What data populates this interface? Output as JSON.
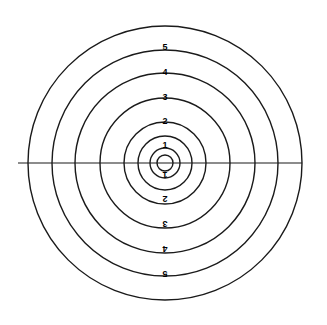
{
  "figure": {
    "name": "concentric-ring-shooting-target",
    "width": 327,
    "height": 325,
    "background_color": "#ffffff",
    "stroke_color": "#1a1a1a",
    "label_color": "#000000"
  },
  "chart_data": {
    "type": "scatter",
    "title": "",
    "subtitle": "",
    "xlabel": "",
    "ylabel": "",
    "grid": false,
    "legend": null,
    "center": {
      "x": 165,
      "y": 163
    },
    "rings": [
      {
        "label": "",
        "radius": 8,
        "stroke_width": 1.4
      },
      {
        "label": "",
        "radius": 15,
        "stroke_width": 1.4
      },
      {
        "label": "1",
        "radius": 27,
        "stroke_width": 1.4
      },
      {
        "label": "2",
        "radius": 41,
        "stroke_width": 1.4
      },
      {
        "label": "3",
        "radius": 65,
        "stroke_width": 1.4
      },
      {
        "label": "4",
        "radius": 90,
        "stroke_width": 1.4
      },
      {
        "label": "5",
        "radius": 113,
        "stroke_width": 1.4
      },
      {
        "label": "",
        "radius": 137,
        "stroke_width": 1.4
      }
    ],
    "axis_line": {
      "orientation": "horizontal",
      "x1": 18,
      "x2": 302,
      "y": 163,
      "stroke_width": 1.2
    },
    "labels_top": [
      {
        "text": "1",
        "x": 165,
        "y": 148,
        "rotation": 0,
        "font_size": 9
      },
      {
        "text": "2",
        "x": 165,
        "y": 124,
        "rotation": 0,
        "font_size": 9
      },
      {
        "text": "3",
        "x": 165,
        "y": 100,
        "rotation": 0,
        "font_size": 9
      },
      {
        "text": "4",
        "x": 165,
        "y": 75,
        "rotation": 0,
        "font_size": 9
      },
      {
        "text": "5",
        "x": 165,
        "y": 50,
        "rotation": 0,
        "font_size": 9
      }
    ],
    "labels_bottom": [
      {
        "text": "1",
        "x": 165,
        "y": 178,
        "rotation": 180,
        "font_size": 9
      },
      {
        "text": "2",
        "x": 165,
        "y": 202,
        "rotation": 180,
        "font_size": 9
      },
      {
        "text": "3",
        "x": 165,
        "y": 227,
        "rotation": 180,
        "font_size": 9
      },
      {
        "text": "4",
        "x": 165,
        "y": 252,
        "rotation": 180,
        "font_size": 9
      },
      {
        "text": "5",
        "x": 165,
        "y": 277,
        "rotation": 180,
        "font_size": 9
      }
    ]
  }
}
